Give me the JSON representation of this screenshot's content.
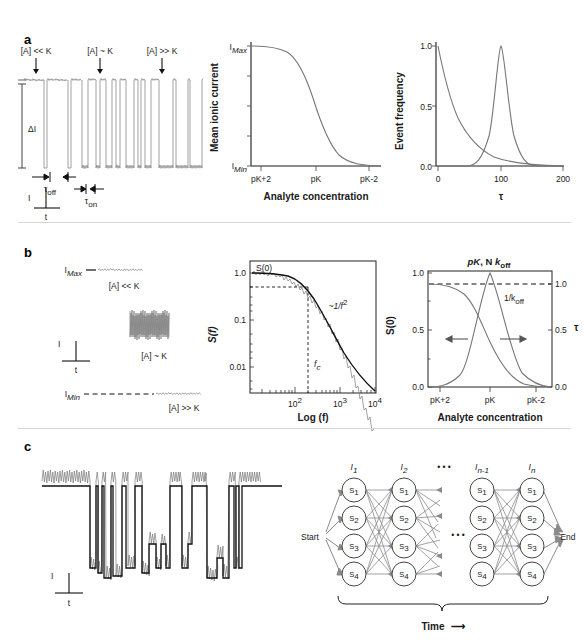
{
  "figure": {
    "panels": [
      "a",
      "b",
      "c"
    ]
  },
  "panel_a": {
    "letter": "a",
    "trace": {
      "annotations": [
        "[A] << K",
        "[A] ~ K",
        "[A] >> K"
      ],
      "delta_i_label": "ΔI",
      "tau_off_label": "τ",
      "tau_off_sub": "off",
      "tau_on_label": "τ",
      "tau_on_sub": "on",
      "scale_i": "I",
      "scale_t": "t"
    },
    "chart_mid": {
      "type": "line",
      "title": "",
      "ylabel": "Mean ionic current",
      "xlabel": "Analyte concentration",
      "ytick_labels": [
        "I",
        "I"
      ],
      "ytick_sub_top": "Max",
      "ytick_sub_bot": "Min",
      "xtick_labels": [
        "pK+2",
        "pK",
        "pK-2"
      ],
      "x": [
        0,
        10,
        20,
        30,
        40,
        50,
        60,
        70,
        80,
        90,
        100
      ],
      "y": [
        1.0,
        0.99,
        0.97,
        0.92,
        0.8,
        0.5,
        0.22,
        0.09,
        0.04,
        0.015,
        0.0
      ],
      "grid": false
    },
    "chart_right": {
      "type": "line",
      "ylabel": "Event frequency",
      "xlabel": "τ",
      "ytick_labels": [
        "0.0",
        "0.5",
        "1.0"
      ],
      "xtick_labels": [
        "0",
        "100",
        "200"
      ],
      "xlim": [
        0,
        200
      ],
      "ylim": [
        0.0,
        1.0
      ],
      "series": [
        {
          "name": "exponential-decay",
          "x": [
            0,
            10,
            20,
            30,
            40,
            50,
            60,
            70,
            80,
            100,
            120,
            150,
            200
          ],
          "y": [
            1.0,
            0.74,
            0.55,
            0.41,
            0.3,
            0.22,
            0.17,
            0.12,
            0.09,
            0.05,
            0.03,
            0.015,
            0.005
          ]
        },
        {
          "name": "gaussian-peak",
          "x": [
            60,
            70,
            80,
            90,
            95,
            100,
            105,
            110,
            120,
            130,
            150,
            200
          ],
          "y": [
            0.0,
            0.02,
            0.1,
            0.45,
            0.78,
            1.0,
            0.8,
            0.48,
            0.13,
            0.04,
            0.01,
            0.0
          ]
        }
      ]
    }
  },
  "panel_b": {
    "letter": "b",
    "trace": {
      "i_max_label": "I",
      "i_max_sub": "Max",
      "i_min_label": "I",
      "i_min_sub": "Min",
      "annotations": [
        "[A] << K",
        "[A] ~ K",
        "[A] >> K"
      ],
      "scale_i": "I",
      "scale_t": "t"
    },
    "chart_mid": {
      "type": "line",
      "ylabel": "S(f)",
      "xlabel": "Log (f)",
      "s0_label": "S(0)",
      "fc_label": "f",
      "fc_sub": "c",
      "slope_label": "~1/f",
      "slope_exp": "2",
      "ytick_labels": [
        "0.01",
        "0.1",
        "1.0"
      ],
      "xtick_labels": [
        "10",
        "10",
        "10"
      ],
      "xtick_exps": [
        "2",
        "3",
        "4"
      ],
      "xlim_log": [
        1,
        4
      ],
      "ylim_log": [
        -2.4,
        0.2
      ],
      "corner_frequency": 300,
      "lorentzian_S0": 1.0
    },
    "chart_right": {
      "type": "line",
      "title_parts": [
        "pK",
        ", N ",
        "k",
        "off"
      ],
      "title": "pK, N koff",
      "ylabel_left": "S(0)",
      "ylabel_right": "τ",
      "xlabel": "Analyte concentration",
      "ytick_left": [
        "0.0",
        "0.5",
        "1.0"
      ],
      "ytick_right": [
        "0.0",
        "0.5",
        "1.0"
      ],
      "xtick_labels": [
        "pK+2",
        "pK",
        "pK-2"
      ],
      "dashed_label": "1/k",
      "dashed_sub": "off",
      "dashed_level": 0.9,
      "series": [
        {
          "name": "S0-sigmoid-decreasing",
          "x": [
            0,
            10,
            20,
            30,
            40,
            50,
            60,
            70,
            80,
            90,
            100
          ],
          "y": [
            0.9,
            0.89,
            0.86,
            0.8,
            0.68,
            0.5,
            0.3,
            0.15,
            0.06,
            0.02,
            0.0
          ]
        },
        {
          "name": "tau-peak",
          "x": [
            0,
            10,
            20,
            30,
            40,
            50,
            55,
            60,
            70,
            80,
            90,
            100
          ],
          "y": [
            0.0,
            0.01,
            0.04,
            0.12,
            0.33,
            0.7,
            0.92,
            1.0,
            0.7,
            0.36,
            0.14,
            0.02
          ]
        }
      ],
      "arrow_left": "←",
      "arrow_right": "→"
    }
  },
  "panel_c": {
    "letter": "c",
    "trace": {
      "scale_i": "I",
      "scale_t": "t"
    },
    "hmm": {
      "column_labels": [
        "I",
        "I",
        "I",
        "I"
      ],
      "column_subs": [
        "1",
        "2",
        "n-1",
        "n"
      ],
      "ellipsis": "• • •",
      "states": [
        "S",
        "S",
        "S",
        "S"
      ],
      "state_subs": [
        "1",
        "2",
        "3",
        "4"
      ],
      "start_label": "Start",
      "end_label": "End",
      "time_label": "Time",
      "time_arrow": "⟶"
    }
  }
}
